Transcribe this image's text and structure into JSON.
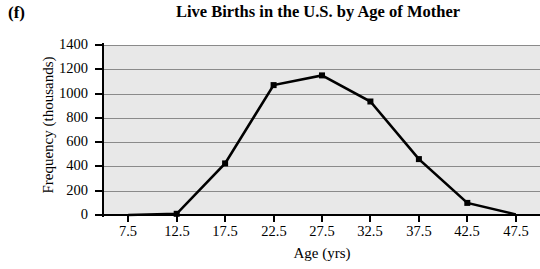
{
  "panel": {
    "label": "(f)"
  },
  "chart_data": {
    "type": "line",
    "title": "Live Births in the U.S. by Age of Mother",
    "xlabel": "Age (yrs)",
    "ylabel": "Frequency (thousands)",
    "x": [
      7.5,
      12.5,
      17.5,
      22.5,
      27.5,
      32.5,
      37.5,
      42.5,
      47.5
    ],
    "values": [
      0,
      10,
      425,
      1070,
      1150,
      935,
      460,
      100,
      5
    ],
    "xtick_labels": [
      "7.5",
      "12.5",
      "17.5",
      "22.5",
      "27.5",
      "32.5",
      "37.5",
      "42.5",
      "47.5"
    ],
    "ytick_labels": [
      "1400",
      "1200",
      "1000",
      "800",
      "600",
      "400",
      "200",
      "0"
    ],
    "ytick_values": [
      1400,
      1200,
      1000,
      800,
      600,
      400,
      200,
      0
    ],
    "xlim": [
      5.0,
      50.0
    ],
    "ylim": [
      0,
      1400
    ],
    "grid": "horizontal",
    "legend": "none",
    "marker": "filled-square",
    "line_color": "#000000",
    "marker_color": "#000000",
    "plot_background": "#e8e8e8",
    "gridline_color": "#8a8a8a"
  }
}
